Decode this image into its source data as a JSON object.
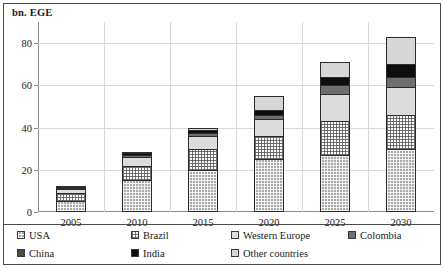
{
  "chart_data": {
    "type": "bar",
    "title": "",
    "subtitle": "",
    "xlabel": "",
    "ylabel": "bn. EGE",
    "categories": [
      "2005",
      "2010",
      "2015",
      "2020",
      "2025",
      "2030"
    ],
    "ylim": [
      0,
      90
    ],
    "yticks": [
      0,
      20,
      40,
      60,
      80
    ],
    "ytick_labels": [
      "0",
      "20",
      "40",
      "60",
      "80"
    ],
    "grid": true,
    "stacked": true,
    "legend_position": "bottom",
    "series": [
      {
        "name": "USA",
        "color": "#a8a8a8",
        "pattern": "cross-hatch-dark",
        "values": [
          5,
          15,
          20,
          25,
          27,
          30
        ]
      },
      {
        "name": "Brazil",
        "color": "#fbfbfb",
        "pattern": "dotted-grid",
        "values": [
          4,
          7,
          10,
          11,
          16,
          16
        ]
      },
      {
        "name": "Western Europe",
        "color": "#dcdcdc",
        "pattern": "solid",
        "values": [
          2,
          4,
          6,
          8,
          13,
          13
        ]
      },
      {
        "name": "Colombia",
        "color": "#6e6e6e",
        "pattern": "solid",
        "values": [
          0.5,
          1,
          1.5,
          2,
          4,
          5
        ]
      },
      {
        "name": "India",
        "color": "#0d0d0d",
        "pattern": "solid",
        "values": [
          0.5,
          1,
          1.5,
          2.5,
          4,
          6
        ]
      },
      {
        "name": "Other countries",
        "color": "#d7d7d7",
        "pattern": "solid",
        "values": [
          0.5,
          0.5,
          1,
          6.5,
          7,
          13
        ]
      }
    ],
    "totals": [
      12.5,
      28.5,
      40,
      55,
      71,
      83
    ]
  },
  "legend": {
    "items": [
      {
        "label": "USA"
      },
      {
        "label": "Brazil"
      },
      {
        "label": "Western Europe"
      },
      {
        "label": "Colombia"
      },
      {
        "label": "China"
      },
      {
        "label": "India"
      },
      {
        "label": "Other countries"
      }
    ]
  },
  "legend_extra": {
    "china": {
      "label": "China",
      "color": "#4a4a4a"
    }
  }
}
